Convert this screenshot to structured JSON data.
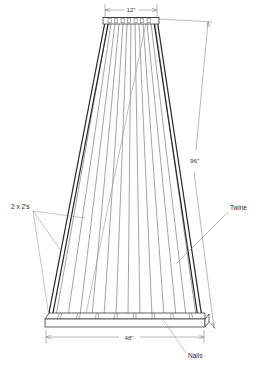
{
  "drawing": {
    "title": "Bean trellis / twine tower construction drawing",
    "background_color": "#ffffff",
    "line_color": "#2a2a2a",
    "twine_color": "#6b6b6b",
    "dimension_color": "#7d7d7d"
  },
  "dimensions": {
    "top_width": "12\"",
    "height": "96\"",
    "bottom_width": "48\""
  },
  "labels": {
    "lumber": "2 x 2's",
    "twine": "Twine",
    "nails": "Nails"
  },
  "counts": {
    "top_nails": 7,
    "bottom_nails": 8,
    "twine_lines": 13,
    "frame_members": 4
  },
  "geometry": {
    "top_board": {
      "left": 103,
      "right": 159,
      "top": 17,
      "bottom": 24
    },
    "bottom_board": {
      "left": 45,
      "right": 205,
      "top": 313,
      "bottom": 327
    },
    "top_dim_y": 9,
    "bottom_dim_y": 338
  }
}
